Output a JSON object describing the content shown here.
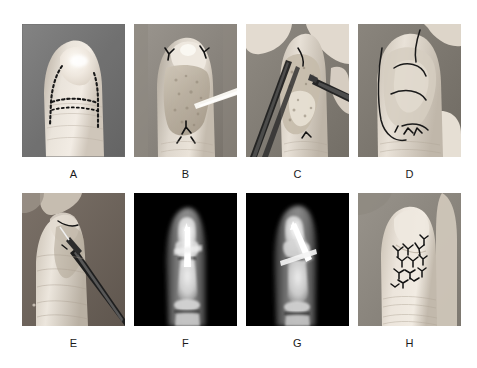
{
  "figure": {
    "type": "multi-panel-clinical-figure",
    "background_color": "#ffffff",
    "panel_count": 8,
    "rows": 2,
    "columns": 4,
    "caption_color": "#1a1a1a",
    "panels": [
      {
        "id": "A",
        "label": "A",
        "media_type": "photograph",
        "alt": "Fingertip with dotted surgical flap markings drawn on skin",
        "background_color": "#7a7a7a",
        "skin_color": "#e8e2da"
      },
      {
        "id": "B",
        "label": "B",
        "media_type": "photograph",
        "alt": "Intraoperative view of elevated fingertip flap with instrument",
        "background_color": "#8a8a8a",
        "skin_color": "#ddd6cc"
      },
      {
        "id": "C",
        "label": "C",
        "media_type": "photograph",
        "alt": "Dissection of finger with forceps and instrument retracting tissue",
        "background_color": "#7f7f7f",
        "skin_color": "#dcd5c9"
      },
      {
        "id": "D",
        "label": "D",
        "media_type": "photograph",
        "alt": "Flap advanced and inset over fingertip defect",
        "background_color": "#828282",
        "skin_color": "#ded8cf"
      },
      {
        "id": "E",
        "label": "E",
        "media_type": "photograph",
        "alt": "Lateral view of finger with K-wire being inserted by driver",
        "background_color": "#6f6f6f",
        "skin_color": "#e2dcd3"
      },
      {
        "id": "F",
        "label": "F",
        "media_type": "radiograph",
        "alt": "Anteroposterior radiograph of finger showing K-wire fixation",
        "background_color": "#000000",
        "bone_color": "#e6e6e6",
        "hardware_color": "#ffffff"
      },
      {
        "id": "G",
        "label": "G",
        "media_type": "radiograph",
        "alt": "Lateral radiograph of finger showing K-wire fixation",
        "background_color": "#000000",
        "bone_color": "#e0e0e0",
        "hardware_color": "#ffffff"
      },
      {
        "id": "H",
        "label": "H",
        "media_type": "photograph",
        "alt": "Finger after closure with multiple interrupted sutures",
        "background_color": "#8c8c8c",
        "skin_color": "#e4ded5"
      }
    ]
  }
}
